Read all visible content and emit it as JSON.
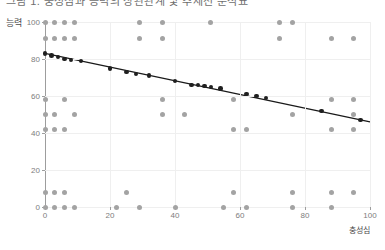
{
  "top_strip": {
    "clipped_text": "그림 1. 충성심과 능력의 상관관계 및 추세선 분석표"
  },
  "chart_data": {
    "type": "scatter",
    "title": "",
    "xlabel": "충성심",
    "ylabel": "능력",
    "xlim": [
      0,
      100
    ],
    "ylim": [
      0,
      100
    ],
    "xticks": [
      0,
      20,
      40,
      60,
      80,
      100
    ],
    "yticks": [
      0,
      20,
      40,
      60,
      80,
      100
    ],
    "grid": true,
    "grid_style": "dotted-light",
    "legend": "none",
    "colors": {
      "scatter_point": "#a3a3a3",
      "trend_point": "#1f1f1f",
      "trend_line": "#1a1a1a",
      "axis": "#9d9d9d",
      "grid": "#efefef",
      "tick_label": "#7d7d7d",
      "axis_label": "#4a4a4a",
      "background": "#ffffff"
    },
    "series": [
      {
        "name": "관측치",
        "marker": "circle",
        "color": "#a3a3a3",
        "points": [
          [
            0,
            100
          ],
          [
            3,
            100
          ],
          [
            6,
            100
          ],
          [
            9,
            100
          ],
          [
            29,
            100
          ],
          [
            36,
            100
          ],
          [
            51,
            100
          ],
          [
            72,
            100
          ],
          [
            76,
            100
          ],
          [
            0,
            91
          ],
          [
            3,
            91
          ],
          [
            6,
            91
          ],
          [
            9,
            91
          ],
          [
            29,
            91
          ],
          [
            36,
            91
          ],
          [
            88,
            91
          ],
          [
            95,
            91
          ],
          [
            0,
            58
          ],
          [
            6,
            58
          ],
          [
            36,
            58
          ],
          [
            58,
            58
          ],
          [
            72,
            91
          ],
          [
            88,
            58
          ],
          [
            95,
            58
          ],
          [
            0,
            50
          ],
          [
            3,
            50
          ],
          [
            9,
            50
          ],
          [
            36,
            50
          ],
          [
            43,
            50
          ],
          [
            76,
            50
          ],
          [
            95,
            50
          ],
          [
            0,
            42
          ],
          [
            3,
            42
          ],
          [
            6,
            42
          ],
          [
            58,
            42
          ],
          [
            62,
            42
          ],
          [
            88,
            42
          ],
          [
            95,
            42
          ],
          [
            0,
            8
          ],
          [
            3,
            8
          ],
          [
            6,
            8
          ],
          [
            25,
            8
          ],
          [
            58,
            8
          ],
          [
            76,
            8
          ],
          [
            88,
            8
          ],
          [
            95,
            8
          ],
          [
            0,
            0
          ],
          [
            3,
            0
          ],
          [
            6,
            0
          ],
          [
            9,
            0
          ],
          [
            22,
            0
          ],
          [
            29,
            0
          ],
          [
            40,
            0
          ],
          [
            55,
            0
          ],
          [
            62,
            0
          ],
          [
            76,
            0
          ],
          [
            88,
            0
          ]
        ]
      },
      {
        "name": "추세선",
        "marker": "circle-filled",
        "color": "#1f1f1f",
        "line": true,
        "points": [
          [
            0,
            83
          ],
          [
            2,
            82
          ],
          [
            4,
            81
          ],
          [
            6,
            80
          ],
          [
            8,
            79.5
          ],
          [
            11,
            79
          ],
          [
            20,
            75
          ],
          [
            25,
            73
          ],
          [
            28,
            72
          ],
          [
            32,
            71
          ],
          [
            40,
            68
          ],
          [
            45,
            66
          ],
          [
            47,
            66
          ],
          [
            49,
            65.5
          ],
          [
            51,
            65
          ],
          [
            54,
            64
          ],
          [
            62,
            61
          ],
          [
            65,
            60
          ],
          [
            68,
            59
          ],
          [
            85,
            52
          ],
          [
            97,
            47
          ]
        ],
        "fit_start": [
          0,
          83
        ],
        "fit_end": [
          100,
          46
        ]
      }
    ]
  }
}
